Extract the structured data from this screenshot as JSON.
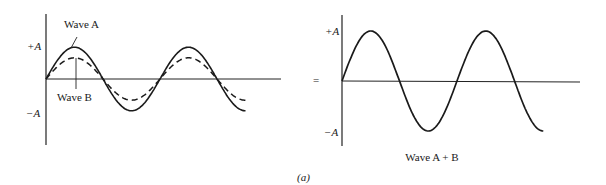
{
  "figure": {
    "caption": "(a)",
    "equals_sign": "="
  },
  "left_panel": {
    "y_top_label": "+A",
    "y_bottom_label": "−A",
    "wave_a_label": "Wave A",
    "wave_b_label": "Wave B"
  },
  "right_panel": {
    "y_top_label": "+A",
    "y_bottom_label": "−A",
    "sum_label": "Wave A + B"
  },
  "chart_data": [
    {
      "type": "line",
      "title": "Two in-phase waves",
      "xlabel": "",
      "ylabel": "",
      "y_ticks": [
        "+A",
        "−A"
      ],
      "series": [
        {
          "name": "Wave A",
          "style": "solid",
          "amplitude": 0.6,
          "cycles": 1.75
        },
        {
          "name": "Wave B",
          "style": "dashed",
          "amplitude": 0.4,
          "cycles": 1.75
        }
      ]
    },
    {
      "type": "line",
      "title": "Wave A + B",
      "xlabel": "",
      "ylabel": "",
      "y_ticks": [
        "+A",
        "−A"
      ],
      "series": [
        {
          "name": "Wave A + B",
          "style": "solid",
          "amplitude": 1.0,
          "cycles": 1.75
        }
      ]
    }
  ]
}
